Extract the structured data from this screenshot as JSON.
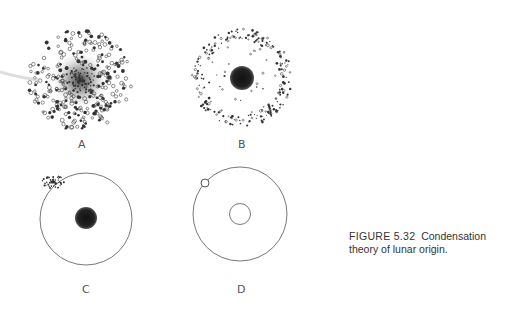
{
  "figure": {
    "number": "FIGURE 5.32",
    "caption_text": "Condensation theory of lunar origin.",
    "panels": [
      {
        "id": "A",
        "label": "A",
        "description": "Diffuse cloud of particles, denser toward center"
      },
      {
        "id": "B",
        "label": "B",
        "description": "Central condensed mass with ring of scattered particles"
      },
      {
        "id": "C",
        "label": "C",
        "description": "Central body with orbit circle and small particle cluster on orbit"
      },
      {
        "id": "D",
        "label": "D",
        "description": "Central body circle, orbit circle, and small moon on orbit"
      }
    ]
  },
  "colors": {
    "ink": "#333333",
    "background": "#ffffff"
  }
}
